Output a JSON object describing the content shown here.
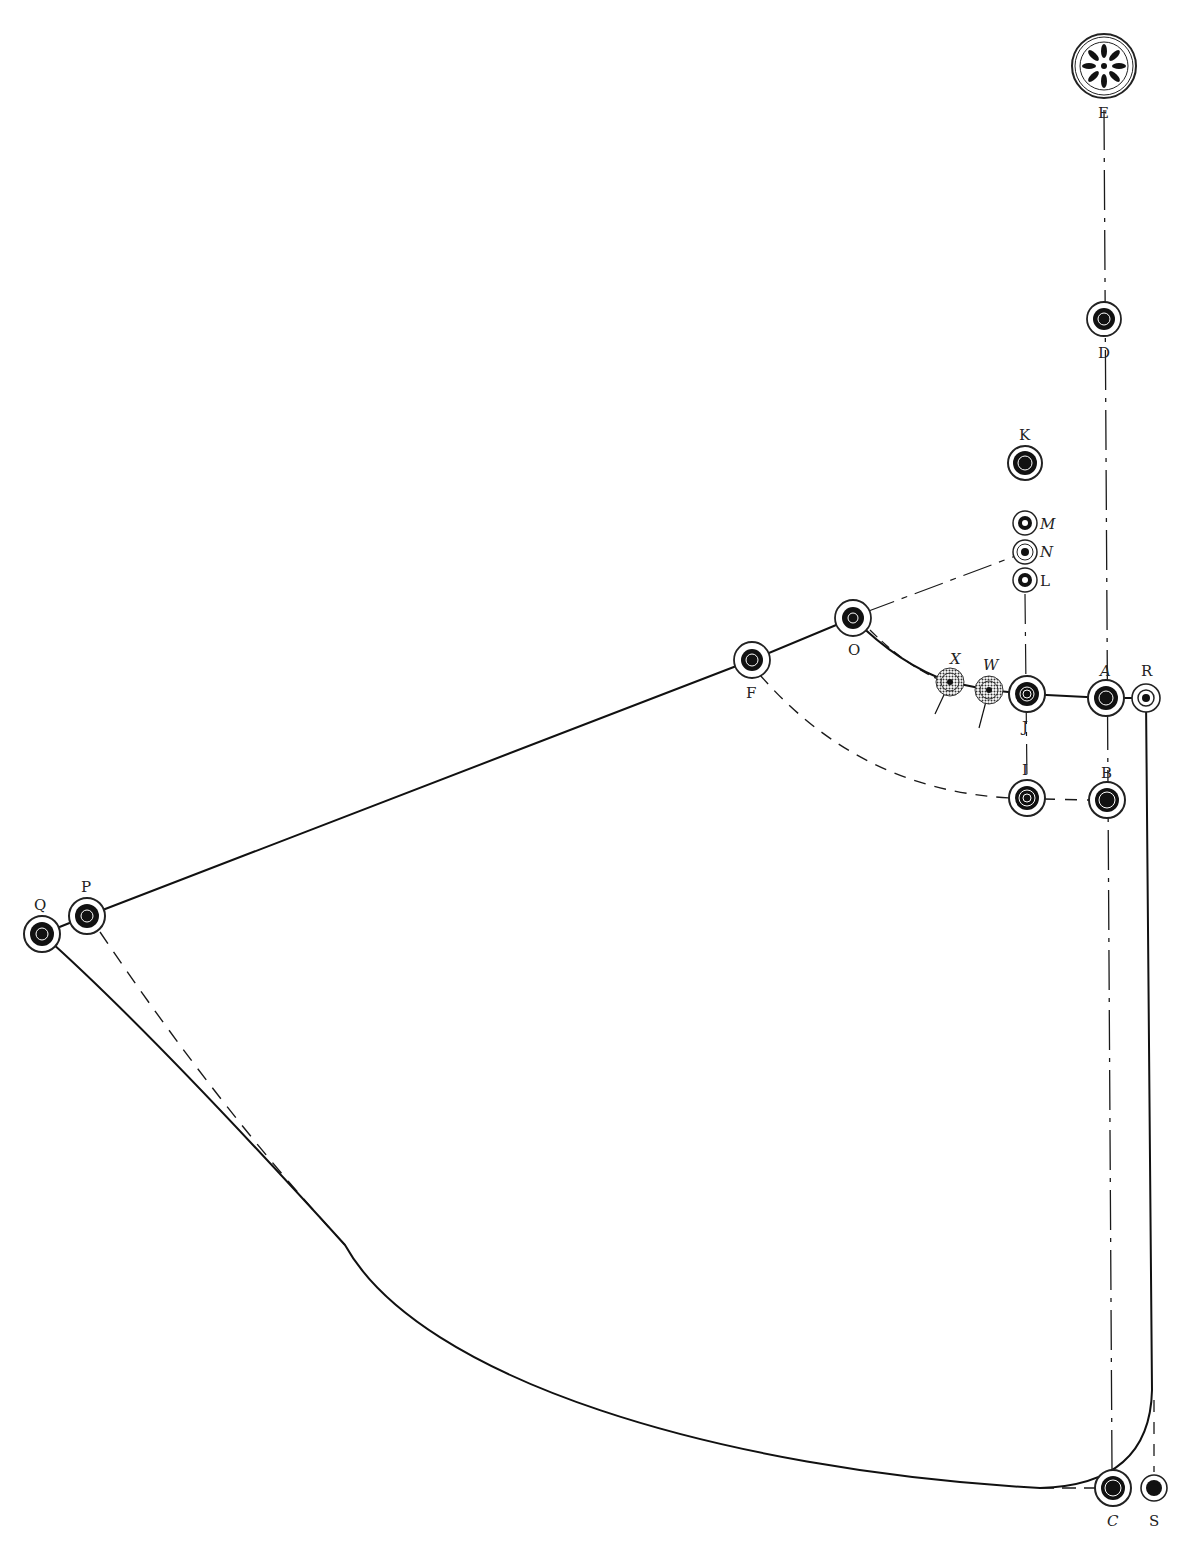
{
  "title": "",
  "colors": {
    "ink": "#1a1a1a",
    "paper": "#ffffff"
  },
  "points": {
    "E": {
      "label": "E",
      "x": 1104,
      "y": 66,
      "style": "rosette"
    },
    "D": {
      "label": "D",
      "x": 1104,
      "y": 319,
      "style": "large"
    },
    "K": {
      "label": "K",
      "x": 1025,
      "y": 463,
      "style": "large-solid"
    },
    "M": {
      "label": "M",
      "x": 1025,
      "y": 523,
      "style": "small"
    },
    "N": {
      "label": "N",
      "x": 1025,
      "y": 552,
      "style": "small-dot"
    },
    "L": {
      "label": "L",
      "x": 1025,
      "y": 580,
      "style": "small"
    },
    "O": {
      "label": "O",
      "x": 853,
      "y": 618,
      "style": "large"
    },
    "F": {
      "label": "F",
      "x": 752,
      "y": 660,
      "style": "large"
    },
    "X": {
      "label": "X",
      "x": 950,
      "y": 682,
      "style": "hatched"
    },
    "W": {
      "label": "W",
      "x": 989,
      "y": 690,
      "style": "hatched"
    },
    "J": {
      "label": "J",
      "x": 1027,
      "y": 694,
      "style": "large"
    },
    "A": {
      "label": "A",
      "x": 1106,
      "y": 698,
      "style": "large"
    },
    "R": {
      "label": "R",
      "x": 1146,
      "y": 698,
      "style": "medium"
    },
    "I": {
      "label": "I",
      "x": 1027,
      "y": 798,
      "style": "large"
    },
    "B": {
      "label": "B",
      "x": 1107,
      "y": 800,
      "style": "large"
    },
    "P": {
      "label": "P",
      "x": 87,
      "y": 916,
      "style": "large"
    },
    "Q": {
      "label": "Q",
      "x": 42,
      "y": 934,
      "style": "large"
    },
    "C": {
      "label": "C",
      "x": 1113,
      "y": 1488,
      "style": "large"
    },
    "S": {
      "label": "S",
      "x": 1154,
      "y": 1488,
      "style": "medium"
    }
  },
  "connections": [
    {
      "from": "Q",
      "to": "F",
      "via": "P",
      "style": "solid",
      "note": "straight line Q-P-F-O"
    },
    {
      "from": "O",
      "to": "R",
      "via": [
        "X",
        "W",
        "J",
        "A"
      ],
      "style": "solid",
      "note": "curve O to R"
    },
    {
      "from": "O",
      "to": "N",
      "style": "dash-dot"
    },
    {
      "from": "L",
      "to": "I",
      "style": "dash-dot",
      "note": "vertical through J"
    },
    {
      "from": "E",
      "to": "C",
      "style": "dash-dot",
      "note": "vertical through D, A, B"
    },
    {
      "from": "F",
      "to": "I",
      "style": "dashed",
      "note": "arc"
    },
    {
      "from": "I",
      "to": "B",
      "style": "dashed"
    },
    {
      "from": "P",
      "to": "Q-curve",
      "style": "dashed",
      "note": "merges with Q curve"
    },
    {
      "from": "Q",
      "to": "C",
      "style": "solid",
      "note": "large curve via R return"
    },
    {
      "from": "R",
      "to": "C",
      "style": "solid",
      "note": "vertical then rounded corner"
    },
    {
      "from": "S",
      "to": "R",
      "style": "dashed",
      "note": "short vertical"
    }
  ]
}
